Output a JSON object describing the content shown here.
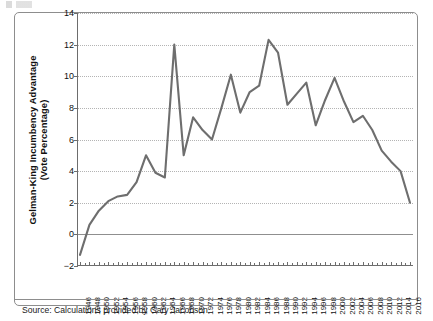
{
  "figure": {
    "source_note": "Source: Calculations provided by Gary Jacobson",
    "line_color": "#6e6e6e",
    "grid_color": "#b4b4b4",
    "axis_color": "#6d6d6d"
  },
  "chart_data": {
    "type": "line",
    "title": "",
    "xlabel": "",
    "ylabel": "Gelman-King Incumbency Advantage (Vote Percentage)",
    "ylabel_line1": "Gelman-King Incumbency Advantage",
    "ylabel_line2": "(Vote Percentage)",
    "ylim": [
      -2,
      14
    ],
    "yticks": [
      -2,
      0,
      2,
      4,
      6,
      8,
      10,
      12,
      14
    ],
    "grid": true,
    "legend": "none",
    "zero_line": 0,
    "x": [
      1946,
      1948,
      1950,
      1952,
      1954,
      1956,
      1958,
      1960,
      1962,
      1964,
      1966,
      1968,
      1970,
      1972,
      1974,
      1976,
      1978,
      1980,
      1982,
      1984,
      1986,
      1988,
      1990,
      1992,
      1994,
      1996,
      1998,
      2000,
      2002,
      2004,
      2006,
      2008,
      2010,
      2012,
      2014,
      2016
    ],
    "categories": [
      "1946",
      "1948",
      "1950",
      "1952",
      "1954",
      "1956",
      "1958",
      "1960",
      "1962",
      "1964",
      "1966",
      "1968",
      "1970",
      "1972",
      "1974",
      "1976",
      "1978",
      "1980",
      "1982",
      "1984",
      "1986",
      "1988",
      "1990",
      "1992",
      "1994",
      "1996",
      "1998",
      "2000",
      "2002",
      "2004",
      "2006",
      "2008",
      "2010",
      "2012",
      "2014",
      "2016"
    ],
    "values": [
      -1.3,
      0.6,
      1.5,
      2.1,
      2.4,
      2.5,
      3.3,
      5.0,
      3.9,
      3.6,
      12.0,
      5.0,
      7.4,
      6.6,
      6.0,
      8.0,
      10.1,
      7.7,
      9.0,
      9.4,
      12.3,
      11.5,
      8.2,
      8.9,
      9.6,
      6.9,
      8.5,
      9.9,
      8.4,
      7.1,
      7.5,
      6.6,
      5.3,
      4.6,
      4.0,
      2.0
    ],
    "series": [
      {
        "name": "Gelman-King Incumbency Advantage",
        "values": [
          -1.3,
          0.6,
          1.5,
          2.1,
          2.4,
          2.5,
          3.3,
          5.0,
          3.9,
          3.6,
          12.0,
          5.0,
          7.4,
          6.6,
          6.0,
          8.0,
          10.1,
          7.7,
          9.0,
          9.4,
          12.3,
          11.5,
          8.2,
          8.9,
          9.6,
          6.9,
          8.5,
          9.9,
          8.4,
          7.1,
          7.5,
          6.6,
          5.3,
          4.6,
          4.0,
          2.0
        ]
      }
    ]
  }
}
